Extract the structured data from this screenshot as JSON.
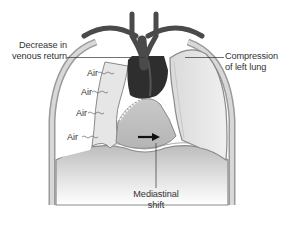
{
  "diagram": {
    "labels": {
      "venous": [
        "Decrease in",
        "venous return"
      ],
      "lung": [
        "Compression",
        "of left lung"
      ],
      "shift": [
        "Mediastinal",
        "shift"
      ],
      "air": [
        "Air",
        "Air",
        "Air",
        "Air"
      ]
    },
    "colors": {
      "vessel": "#4a4a4a",
      "heart_dark": "#2e2e2e",
      "lung_fill": "#e2e2e2",
      "pleura": "#bdbdbd",
      "text": "#333333",
      "arrow": "#111111"
    }
  }
}
